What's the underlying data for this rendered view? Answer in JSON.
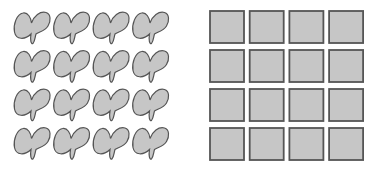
{
  "figure": {
    "panels": [
      {
        "name": "irregular-shapes-grid",
        "shape": "blob",
        "rows": 4,
        "cols": 4,
        "origin": [
          13,
          10
        ],
        "pitch": [
          39.5,
          38.5
        ],
        "size": [
          38,
          35
        ]
      },
      {
        "name": "square-grid",
        "shape": "square",
        "rows": 4,
        "cols": 4,
        "origin": [
          210,
          11
        ],
        "pitch": [
          39.7,
          39
        ],
        "size": [
          34,
          32
        ]
      }
    ],
    "colors": {
      "fill": "#c6c6c6",
      "stroke": "#555555",
      "background": "#ffffff"
    }
  }
}
